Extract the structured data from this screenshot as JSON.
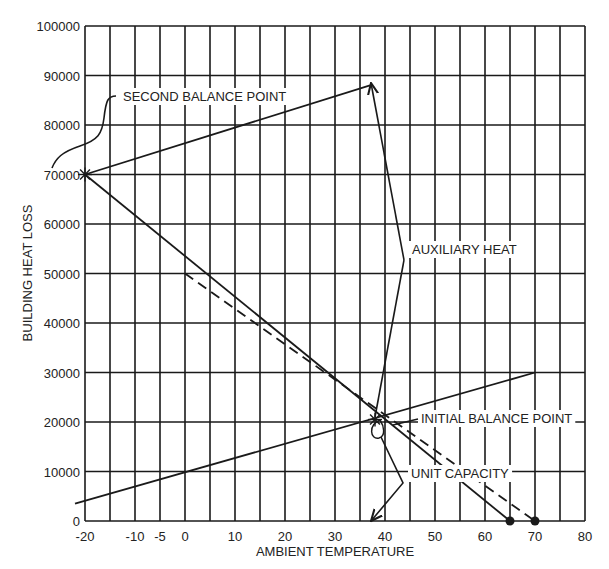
{
  "chart_data": {
    "type": "line",
    "title": "",
    "xlabel": "AMBIENT TEMPERATURE",
    "ylabel": "BUILDING HEAT LOSS",
    "xlim": [
      -20,
      80
    ],
    "ylim": [
      0,
      100000
    ],
    "grid": true,
    "x_grid_step": 5,
    "y_grid_step": 10000,
    "x_tick_labels": [
      {
        "value": -20,
        "label": "-20"
      },
      {
        "value": -10,
        "label": "-10"
      },
      {
        "value": -5,
        "label": "-5"
      },
      {
        "value": 0,
        "label": "0"
      },
      {
        "value": 10,
        "label": "10"
      },
      {
        "value": 20,
        "label": "20"
      },
      {
        "value": 30,
        "label": "30"
      },
      {
        "value": 40,
        "label": "40"
      },
      {
        "value": 50,
        "label": "50"
      },
      {
        "value": 60,
        "label": "60"
      },
      {
        "value": 70,
        "label": "70"
      },
      {
        "value": 80,
        "label": "80"
      }
    ],
    "y_tick_labels": [
      {
        "value": 0,
        "label": "0"
      },
      {
        "value": 10000,
        "label": "10000"
      },
      {
        "value": 20000,
        "label": "20000"
      },
      {
        "value": 30000,
        "label": "30000"
      },
      {
        "value": 40000,
        "label": "40000"
      },
      {
        "value": 50000,
        "label": "50000"
      },
      {
        "value": 60000,
        "label": "60000"
      },
      {
        "value": 70000,
        "label": "70000"
      },
      {
        "value": 80000,
        "label": "80000"
      },
      {
        "value": 90000,
        "label": "90000"
      },
      {
        "value": 100000,
        "label": "100000"
      }
    ],
    "series": [
      {
        "name": "Building heat loss (solid)",
        "style": "solid",
        "x": [
          -20,
          65
        ],
        "y": [
          70000,
          0
        ],
        "end_marker": "dot"
      },
      {
        "name": "Building heat loss (dashed)",
        "style": "dashed",
        "x": [
          0,
          70
        ],
        "y": [
          50000,
          0
        ],
        "end_marker": "dot"
      },
      {
        "name": "Unit capacity",
        "style": "solid",
        "x": [
          -22,
          70
        ],
        "y": [
          3500,
          30000
        ]
      },
      {
        "name": "Unit capacity + auxiliary heat",
        "style": "solid",
        "x": [
          -20,
          37
        ],
        "y": [
          70000,
          88000
        ]
      }
    ],
    "annotations": [
      {
        "text": "SECOND BALANCE POINT",
        "x": -20,
        "y": 70000
      },
      {
        "text": "AUXILIARY HEAT",
        "x": 37,
        "y": 88000
      },
      {
        "text": "INITIAL BALANCE POINT",
        "x": 38,
        "y": 20500
      },
      {
        "text": "UNIT CAPACITY",
        "x": 37,
        "y": 0
      }
    ]
  }
}
